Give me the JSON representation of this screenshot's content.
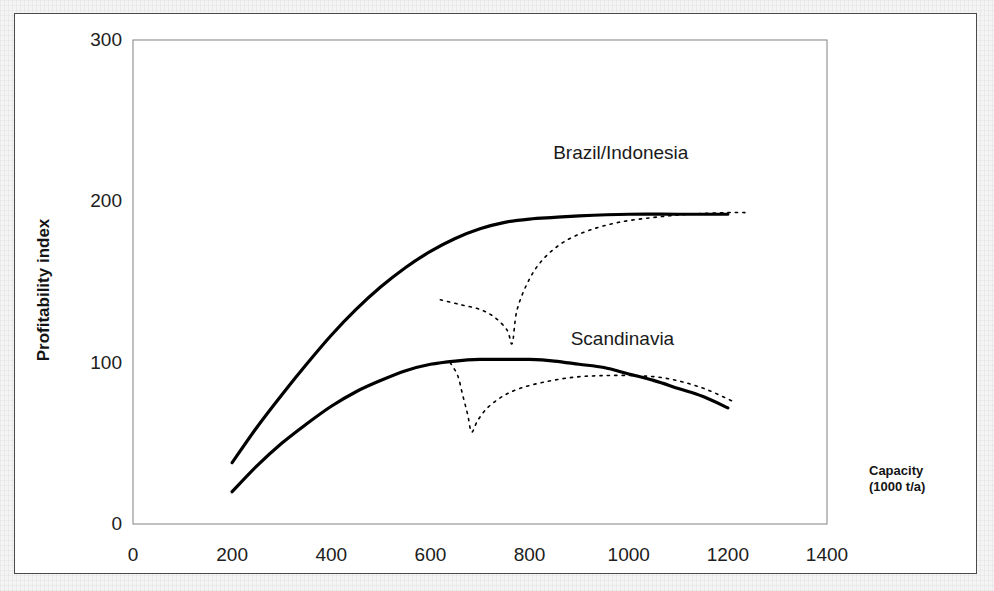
{
  "chart_data": {
    "type": "line",
    "title": "",
    "xlabel": "Capacity (1000 t/a)",
    "ylabel": "Profitability index",
    "xlim": [
      0,
      1400
    ],
    "ylim": [
      0,
      300
    ],
    "xticks": [
      0,
      200,
      400,
      600,
      800,
      1000,
      1200,
      1400
    ],
    "yticks": [
      0,
      100,
      200,
      300
    ],
    "grid": false,
    "legend_position": "inline-right",
    "series": [
      {
        "name": "Brazil/Indonesia",
        "style": "solid",
        "label_x": 1120,
        "label_y": 213,
        "points": [
          [
            200,
            38
          ],
          [
            250,
            60
          ],
          [
            300,
            80
          ],
          [
            350,
            99
          ],
          [
            400,
            117
          ],
          [
            450,
            133
          ],
          [
            500,
            147
          ],
          [
            550,
            159
          ],
          [
            600,
            169
          ],
          [
            650,
            177
          ],
          [
            700,
            183
          ],
          [
            750,
            187
          ],
          [
            800,
            189
          ],
          [
            850,
            190
          ],
          [
            900,
            191
          ],
          [
            1000,
            192
          ],
          [
            1100,
            192
          ],
          [
            1200,
            192
          ]
        ]
      },
      {
        "name": "Brazil/Indonesia (stepped expansion)",
        "style": "dotted",
        "points": [
          [
            620,
            139
          ],
          [
            660,
            136
          ],
          [
            700,
            133
          ],
          [
            730,
            128
          ],
          [
            755,
            120
          ],
          [
            765,
            112
          ],
          [
            775,
            133
          ],
          [
            800,
            152
          ],
          [
            830,
            165
          ],
          [
            870,
            175
          ],
          [
            920,
            182
          ],
          [
            980,
            187
          ],
          [
            1050,
            190
          ],
          [
            1120,
            192
          ],
          [
            1200,
            193
          ],
          [
            1240,
            193
          ]
        ]
      },
      {
        "name": "Scandinavia",
        "style": "solid",
        "label_x": 1125,
        "label_y": 98,
        "points": [
          [
            200,
            20
          ],
          [
            250,
            36
          ],
          [
            300,
            50
          ],
          [
            350,
            62
          ],
          [
            400,
            73
          ],
          [
            450,
            82
          ],
          [
            500,
            89
          ],
          [
            550,
            95
          ],
          [
            600,
            99
          ],
          [
            650,
            101
          ],
          [
            700,
            102
          ],
          [
            750,
            102
          ],
          [
            800,
            102
          ],
          [
            850,
            101
          ],
          [
            900,
            99
          ],
          [
            950,
            97
          ],
          [
            1000,
            93
          ],
          [
            1050,
            89
          ],
          [
            1100,
            84
          ],
          [
            1150,
            79
          ],
          [
            1200,
            72
          ]
        ]
      },
      {
        "name": "Scandinavia (stepped expansion)",
        "style": "dotted",
        "points": [
          [
            640,
            100
          ],
          [
            655,
            92
          ],
          [
            665,
            80
          ],
          [
            675,
            68
          ],
          [
            683,
            57
          ],
          [
            695,
            64
          ],
          [
            715,
            72
          ],
          [
            745,
            79
          ],
          [
            780,
            84
          ],
          [
            830,
            88
          ],
          [
            890,
            91
          ],
          [
            950,
            92
          ],
          [
            1010,
            92
          ],
          [
            1060,
            91
          ],
          [
            1110,
            88
          ],
          [
            1160,
            83
          ],
          [
            1210,
            76
          ]
        ]
      }
    ],
    "annotations": []
  },
  "axis": {
    "x_tick_labels": [
      "0",
      "200",
      "400",
      "600",
      "800",
      "1000",
      "1200",
      "1400"
    ],
    "y_tick_labels": [
      "0",
      "100",
      "200",
      "300"
    ],
    "y_axis_title": "Profitability index",
    "x_axis_title_line1": "Capacity",
    "x_axis_title_line2": "(1000 t/a)"
  },
  "labels": {
    "brazil": "Brazil/Indonesia",
    "scandinavia": "Scandinavia"
  },
  "colors": {
    "curve": "#000000",
    "axis": "#8c8c8c",
    "frame": "#4a4a4a",
    "text": "#1a1a1a",
    "page_background": "#f2f2f2",
    "plot_background": "#ffffff"
  }
}
